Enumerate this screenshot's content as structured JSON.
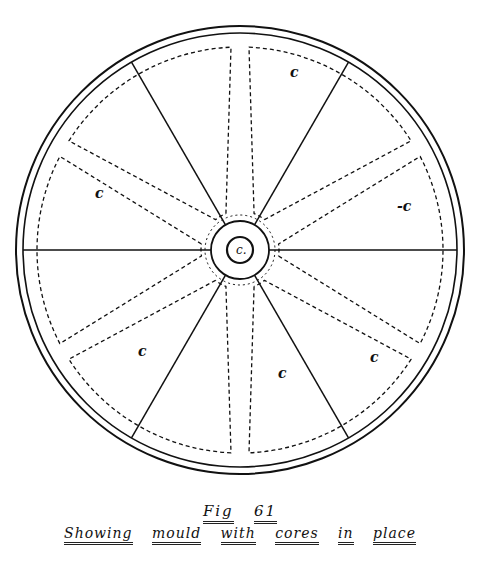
{
  "figure": {
    "title_word": "Fig",
    "title_number": "61",
    "caption_words": [
      "Showing",
      "mould",
      "with",
      "cores",
      "in",
      "place"
    ],
    "core_label": "c",
    "hub_label": "c.",
    "labeled_cores": [
      {
        "label": "c",
        "x": 290,
        "y": 77
      },
      {
        "label": "c",
        "x": 95,
        "y": 198
      },
      {
        "label": "-c",
        "x": 397,
        "y": 211
      },
      {
        "label": "c",
        "x": 138,
        "y": 356
      },
      {
        "label": "c",
        "x": 278,
        "y": 378
      },
      {
        "label": "c",
        "x": 370,
        "y": 362
      }
    ]
  },
  "geometry": {
    "center": [
      240,
      250
    ],
    "outer_radius": 224,
    "inner_rim_radius": 217,
    "hub_radius": 29,
    "boss_radius": 13,
    "spoke_angles_deg": [
      0,
      60,
      120,
      180,
      240,
      300
    ],
    "arm_angles_deg": [
      30,
      90,
      150,
      210,
      270,
      330
    ],
    "line_color": "#111111"
  }
}
